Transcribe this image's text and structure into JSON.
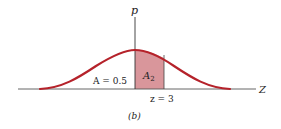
{
  "figure": {
    "caption": "(b)",
    "y_axis_label": "p",
    "x_axis_label": "Z",
    "left_area_label": "A = 0.5",
    "shaded_area_label_main": "A",
    "shaded_area_label_sub": "2",
    "z_marker_label": "z = 3"
  },
  "colors": {
    "curve": "#b5222a",
    "shade": "#d9969b",
    "axis": "#333333",
    "text": "#222222"
  }
}
